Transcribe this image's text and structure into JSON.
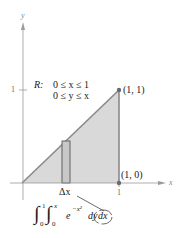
{
  "axes": {
    "x_label": "x",
    "y_label": "y",
    "x_tick": "1",
    "y_tick": "1"
  },
  "region": {
    "label": "R:",
    "line1": "0 ≤ x ≤ 1",
    "line2": "0 ≤ y ≤ x"
  },
  "points": {
    "top": "(1, 1)",
    "bottom": "(1, 0)"
  },
  "strip": {
    "label": "Δx"
  },
  "integral": {
    "outer_upper": "1",
    "outer_lower": "0",
    "inner_upper": "x",
    "inner_lower": "0",
    "integrand": "e",
    "exponent": "−x²",
    "dy": "dy",
    "dx": "dx"
  },
  "colors": {
    "fill": "#d9d9d9",
    "edge": "#8a8a8a",
    "axis": "#9a9a9a",
    "point": "#6a6a6a"
  }
}
